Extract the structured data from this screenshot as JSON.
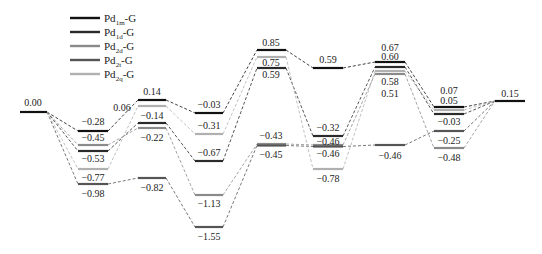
{
  "diagram": {
    "type": "energy-profile",
    "legend": [
      {
        "base": "Pd",
        "sub": "1m",
        "suffix": "-G",
        "color": "#111111",
        "width": 2.4
      },
      {
        "base": "Pd",
        "sub": "1d",
        "suffix": "-G",
        "color": "#2a2a2a",
        "width": 2.4
      },
      {
        "base": "Pd",
        "sub": "2d",
        "suffix": "-G",
        "color": "#8a8a8a",
        "width": 2.4
      },
      {
        "base": "Pd",
        "sub": "2t",
        "suffix": "-G",
        "color": "#555555",
        "width": 2.4
      },
      {
        "base": "Pd",
        "sub": "2q",
        "suffix": "-G",
        "color": "#b0b0b0",
        "width": 2.4
      }
    ],
    "series_levels": {
      "Pd1m-G": [
        "0.00",
        "-0.28",
        "0.14",
        "-0.03",
        "0.85",
        "0.59",
        "0.67",
        "0.07",
        "0.15"
      ],
      "Pd1d-G": [
        "0.00",
        "-0.53",
        "-0.14",
        "-0.67",
        "0.59",
        "-0.32",
        "0.60",
        "-0.03",
        "0.15"
      ],
      "Pd2d-G": [
        "0.00",
        "-0.45",
        "-0.22",
        "-1.13",
        "-0.43",
        "-0.46",
        "0.51",
        "-0.48",
        "0.15"
      ],
      "Pd2t-G": [
        "0.00",
        "-0.98",
        "-0.82",
        "-1.55",
        "-0.45",
        "-0.46",
        "-0.46",
        "-0.25",
        "0.15"
      ],
      "Pd2q-G": [
        "0.00",
        "-0.77",
        "0.06",
        "-0.31",
        "0.75",
        "-0.78",
        "0.58",
        "0.05",
        "0.15"
      ]
    },
    "levels": [
      {
        "id": "start",
        "x1": 20,
        "x2": 47,
        "y": 112,
        "color": "#111111",
        "label": "0.00",
        "lx": 33,
        "ly": 106
      },
      {
        "id": "c1-a",
        "x1": 78,
        "x2": 108,
        "y": 131,
        "color": "#111111",
        "label": "-0.28",
        "lx": 93,
        "ly": 125
      },
      {
        "id": "c1-b",
        "x1": 78,
        "x2": 108,
        "y": 145,
        "color": "#8a8a8a",
        "label": "-0.45",
        "lx": 93,
        "ly": 141
      },
      {
        "id": "c1-c",
        "x1": 78,
        "x2": 108,
        "y": 151,
        "color": "#2a2a2a",
        "label": "-0.53",
        "lx": 93,
        "ly": 162
      },
      {
        "id": "c1-d",
        "x1": 78,
        "x2": 108,
        "y": 169,
        "color": "#b0b0b0",
        "label": "-0.77",
        "lx": 93,
        "ly": 181
      },
      {
        "id": "c1-e",
        "x1": 78,
        "x2": 108,
        "y": 184,
        "color": "#555555",
        "label": "-0.98",
        "lx": 93,
        "ly": 197
      },
      {
        "id": "c2-a",
        "x1": 138,
        "x2": 166,
        "y": 100,
        "color": "#111111",
        "label": "0.14",
        "lx": 152,
        "ly": 95
      },
      {
        "id": "c2-b",
        "x1": 138,
        "x2": 166,
        "y": 106,
        "color": "#b0b0b0",
        "label": "0.06",
        "lx": 122,
        "ly": 111
      },
      {
        "id": "c2-c",
        "x1": 138,
        "x2": 166,
        "y": 123,
        "color": "#2a2a2a",
        "label": "-0.14",
        "lx": 152,
        "ly": 119
      },
      {
        "id": "c2-d",
        "x1": 138,
        "x2": 166,
        "y": 128,
        "color": "#8a8a8a",
        "label": "-0.22",
        "lx": 152,
        "ly": 141
      },
      {
        "id": "c2-e",
        "x1": 138,
        "x2": 166,
        "y": 178,
        "color": "#555555",
        "label": "-0.82",
        "lx": 152,
        "ly": 191
      },
      {
        "id": "c3-a",
        "x1": 195,
        "x2": 223,
        "y": 113,
        "color": "#111111",
        "label": "-0.03",
        "lx": 209,
        "ly": 108
      },
      {
        "id": "c3-b",
        "x1": 195,
        "x2": 223,
        "y": 134,
        "color": "#b0b0b0",
        "label": "-0.31",
        "lx": 209,
        "ly": 129
      },
      {
        "id": "c3-c",
        "x1": 195,
        "x2": 223,
        "y": 161,
        "color": "#2a2a2a",
        "label": "-0.67",
        "lx": 209,
        "ly": 156
      },
      {
        "id": "c3-d",
        "x1": 195,
        "x2": 223,
        "y": 195,
        "color": "#8a8a8a",
        "label": "-1.13",
        "lx": 209,
        "ly": 207
      },
      {
        "id": "c3-e",
        "x1": 195,
        "x2": 223,
        "y": 227,
        "color": "#555555",
        "label": "-1.55",
        "lx": 209,
        "ly": 240
      },
      {
        "id": "c4-a",
        "x1": 257,
        "x2": 286,
        "y": 50,
        "color": "#111111",
        "label": "0.85",
        "lx": 271,
        "ly": 46
      },
      {
        "id": "c4-b",
        "x1": 257,
        "x2": 286,
        "y": 57,
        "color": "#b0b0b0",
        "label": "0.75",
        "lx": 271,
        "ly": 66
      },
      {
        "id": "c4-c",
        "x1": 257,
        "x2": 286,
        "y": 68,
        "color": "#2a2a2a",
        "label": "0.59",
        "lx": 271,
        "ly": 78
      },
      {
        "id": "c4-d",
        "x1": 257,
        "x2": 286,
        "y": 144,
        "color": "#8a8a8a",
        "label": "-0.43",
        "lx": 271,
        "ly": 139
      },
      {
        "id": "c4-e",
        "x1": 257,
        "x2": 286,
        "y": 145.5,
        "color": "#555555",
        "label": "-0.45",
        "lx": 271,
        "ly": 158
      },
      {
        "id": "c5-a",
        "x1": 313,
        "x2": 343,
        "y": 68,
        "color": "#111111",
        "label": "0.59",
        "lx": 328,
        "ly": 63
      },
      {
        "id": "c5-b",
        "x1": 313,
        "x2": 343,
        "y": 136,
        "color": "#2a2a2a",
        "label": "-0.32",
        "lx": 328,
        "ly": 131
      },
      {
        "id": "c5-c",
        "x1": 313,
        "x2": 343,
        "y": 145,
        "color": "#8a8a8a",
        "label": "-0.46",
        "lx": 328,
        "ly": 145
      },
      {
        "id": "c5-d",
        "x1": 313,
        "x2": 343,
        "y": 146.5,
        "color": "#555555",
        "label": "-0.46",
        "lx": 328,
        "ly": 157
      },
      {
        "id": "c5-e",
        "x1": 313,
        "x2": 343,
        "y": 169,
        "color": "#b0b0b0",
        "label": "-0.78",
        "lx": 328,
        "ly": 182
      },
      {
        "id": "c6-a",
        "x1": 375,
        "x2": 405,
        "y": 62,
        "color": "#111111",
        "label": "0.67",
        "lx": 390,
        "ly": 51
      },
      {
        "id": "c6-b",
        "x1": 375,
        "x2": 405,
        "y": 67,
        "color": "#2a2a2a",
        "label": "0.60",
        "lx": 390,
        "ly": 60
      },
      {
        "id": "c6-c",
        "x1": 375,
        "x2": 405,
        "y": 71,
        "color": "#b0b0b0",
        "label": "0.58",
        "lx": 390,
        "ly": 85
      },
      {
        "id": "c6-d",
        "x1": 375,
        "x2": 405,
        "y": 74,
        "color": "#8a8a8a",
        "label": "0.51",
        "lx": 390,
        "ly": 97
      },
      {
        "id": "c6-e",
        "x1": 375,
        "x2": 405,
        "y": 145,
        "color": "#555555",
        "label": "-0.46",
        "lx": 390,
        "ly": 159
      },
      {
        "id": "c7-a",
        "x1": 434,
        "x2": 464,
        "y": 107,
        "color": "#111111",
        "label": "0.07",
        "lx": 449,
        "ly": 94
      },
      {
        "id": "c7-b",
        "x1": 434,
        "x2": 464,
        "y": 110,
        "color": "#b0b0b0",
        "label": "0.05",
        "lx": 449,
        "ly": 104
      },
      {
        "id": "c7-c",
        "x1": 434,
        "x2": 464,
        "y": 114,
        "color": "#2a2a2a",
        "label": "-0.03",
        "lx": 449,
        "ly": 125
      },
      {
        "id": "c7-d",
        "x1": 434,
        "x2": 464,
        "y": 131,
        "color": "#555555",
        "label": "-0.25",
        "lx": 449,
        "ly": 144
      },
      {
        "id": "c7-e",
        "x1": 434,
        "x2": 464,
        "y": 148,
        "color": "#8a8a8a",
        "label": "-0.48",
        "lx": 449,
        "ly": 161
      },
      {
        "id": "end",
        "x1": 495,
        "x2": 525,
        "y": 101,
        "color": "#111111",
        "label": "0.15",
        "lx": 510,
        "ly": 97
      }
    ],
    "paths": [
      {
        "color": "#111111",
        "ids": [
          "start",
          "c1-a",
          "c2-a",
          "c3-a",
          "c4-a",
          "c5-a",
          "c6-a",
          "c7-a",
          "end"
        ]
      },
      {
        "color": "#2a2a2a",
        "ids": [
          "start",
          "c1-c",
          "c2-c",
          "c3-c",
          "c4-c",
          "c5-b",
          "c6-b",
          "c7-c",
          "end"
        ]
      },
      {
        "color": "#8a8a8a",
        "ids": [
          "start",
          "c1-b",
          "c2-d",
          "c3-d",
          "c4-d",
          "c5-c",
          "c6-d",
          "c7-e",
          "end"
        ]
      },
      {
        "color": "#555555",
        "ids": [
          "start",
          "c1-e",
          "c2-e",
          "c3-e",
          "c4-e",
          "c5-d",
          "c6-e",
          "c7-d",
          "end"
        ]
      },
      {
        "color": "#b0b0b0",
        "ids": [
          "start",
          "c1-d",
          "c2-b",
          "c3-b",
          "c4-b",
          "c5-e",
          "c6-c",
          "c7-b",
          "end"
        ]
      }
    ]
  }
}
